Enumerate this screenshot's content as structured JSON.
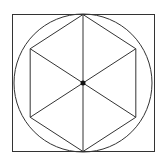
{
  "diagram": {
    "shapes": [
      "square",
      "circle",
      "hexagon",
      "diagonals",
      "center-point"
    ],
    "hexagon_sides": 6,
    "stroke_color": "#333333",
    "background_color": "#ffffff"
  }
}
